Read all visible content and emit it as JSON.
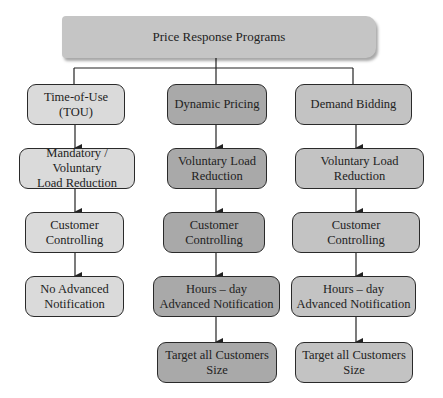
{
  "diagram": {
    "title": "Price Response Programs",
    "columns": [
      {
        "color": "#dadada",
        "nodes": [
          "Time-of-Use\n(TOU)",
          "Mandatory / Voluntary\nLoad Reduction",
          "Customer\nControlling",
          "No Advanced\nNotification"
        ]
      },
      {
        "color": "#a9a9a9",
        "nodes": [
          "Dynamic Pricing",
          "Voluntary Load\nReduction",
          "Customer\nControlling",
          "Hours – day\nAdvanced Notification",
          "Target all Customers\nSize"
        ]
      },
      {
        "color": "#c3c3c3",
        "nodes": [
          "Demand Bidding",
          "Voluntary Load\nReduction",
          "Customer\nControlling",
          "Hours – day\nAdvanced Notification",
          "Target all Customers\nSize"
        ]
      }
    ]
  }
}
